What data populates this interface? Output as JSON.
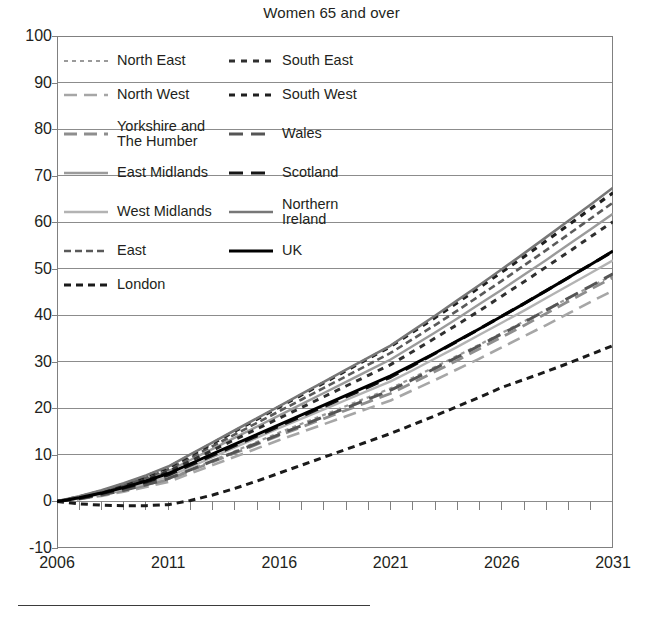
{
  "chart_data": {
    "type": "line",
    "title": "Women 65 and over",
    "xlabel": "",
    "ylabel": "",
    "xlim": [
      2006,
      2031
    ],
    "ylim": [
      -10,
      100
    ],
    "ytick_values": [
      100,
      90,
      80,
      70,
      60,
      50,
      40,
      30,
      20,
      10,
      0,
      -10
    ],
    "ytick_labels": [
      "100",
      "90",
      "80",
      "70",
      "60",
      "50",
      "40",
      "30",
      "20",
      "10",
      "0",
      "-10"
    ],
    "xtick_values": [
      2006,
      2011,
      2016,
      2021,
      2026,
      2031
    ],
    "xtick_labels": [
      "2006",
      "2011",
      "2016",
      "2021",
      "2026",
      "2031"
    ],
    "x_minor_tick_interval": 1,
    "grid": "horizontal",
    "legend_position": "top-left-inside",
    "x": [
      2006,
      2007,
      2008,
      2009,
      2010,
      2011,
      2012,
      2013,
      2014,
      2015,
      2016,
      2017,
      2018,
      2019,
      2020,
      2021,
      2022,
      2023,
      2024,
      2025,
      2026,
      2027,
      2028,
      2029,
      2030,
      2031
    ],
    "series": [
      {
        "name": "North East",
        "color": "#9a9a9a",
        "dash": "4,4",
        "width": 2.2,
        "values": [
          0,
          0.6,
          1.4,
          2.4,
          3.5,
          4.8,
          6.8,
          8.8,
          10.8,
          12.8,
          14.8,
          16.7,
          18.6,
          20.5,
          22.4,
          24.3,
          26.6,
          28.9,
          31.3,
          33.7,
          36.2,
          38.7,
          41.2,
          43.7,
          46.2,
          48.6
        ]
      },
      {
        "name": "North West",
        "color": "#a6a6a6",
        "dash": "13,7",
        "width": 2.6,
        "values": [
          0,
          0.5,
          1.2,
          2.1,
          3.1,
          4.2,
          6.0,
          7.8,
          9.6,
          11.4,
          13.2,
          14.9,
          16.6,
          18.3,
          20.0,
          21.7,
          23.9,
          26.1,
          28.4,
          30.7,
          33.1,
          35.5,
          37.9,
          40.4,
          42.9,
          45.3
        ]
      },
      {
        "name": "Yorkshire and\nThe Humber",
        "color": "#8e8e8e",
        "dash": "13,7",
        "width": 2.8,
        "values": [
          0,
          0.6,
          1.4,
          2.4,
          3.5,
          4.7,
          6.6,
          8.5,
          10.4,
          12.3,
          14.2,
          16.0,
          17.8,
          19.6,
          21.4,
          23.2,
          25.5,
          27.9,
          30.3,
          32.8,
          35.3,
          37.8,
          40.4,
          43.0,
          45.6,
          48.1
        ]
      },
      {
        "name": "East Midlands",
        "color": "#9b9b9b",
        "dash": "none",
        "width": 2.4,
        "values": [
          0,
          0.9,
          2.0,
          3.3,
          4.8,
          6.5,
          8.9,
          11.3,
          13.7,
          16.1,
          18.5,
          20.9,
          23.3,
          25.7,
          28.1,
          30.5,
          33.4,
          36.3,
          39.3,
          42.4,
          45.5,
          48.7,
          51.9,
          55.2,
          58.5,
          61.8
        ]
      },
      {
        "name": "West Midlands",
        "color": "#b3b3b3",
        "dash": "none",
        "width": 2.4,
        "values": [
          0,
          0.7,
          1.6,
          2.7,
          3.9,
          5.3,
          7.4,
          9.5,
          11.6,
          13.7,
          15.8,
          17.8,
          19.8,
          21.8,
          23.8,
          25.8,
          28.2,
          30.7,
          33.2,
          35.8,
          38.4,
          41.0,
          43.7,
          46.4,
          49.1,
          51.8
        ]
      },
      {
        "name": "East",
        "color": "#5a5a5a",
        "dash": "7,4",
        "width": 2.6,
        "values": [
          0,
          0.9,
          2.1,
          3.5,
          5.1,
          6.9,
          9.4,
          11.9,
          14.4,
          16.9,
          19.4,
          21.9,
          24.4,
          26.9,
          29.4,
          31.9,
          34.9,
          37.9,
          41.0,
          44.2,
          47.4,
          50.7,
          54.0,
          57.4,
          60.8,
          64.2
        ]
      },
      {
        "name": "London",
        "color": "#1a1a1a",
        "dash": "7,5",
        "width": 3.0,
        "values": [
          0,
          -0.5,
          -0.8,
          -0.9,
          -0.9,
          -0.7,
          0.2,
          1.4,
          2.8,
          4.4,
          6.1,
          7.8,
          9.5,
          11.2,
          12.9,
          14.6,
          16.5,
          18.4,
          20.4,
          22.4,
          24.5,
          26.2,
          27.9,
          29.7,
          31.6,
          33.5
        ]
      },
      {
        "name": "South East",
        "color": "#2f2f2f",
        "dash": "6,6",
        "width": 3.0,
        "values": [
          0,
          0.8,
          1.9,
          3.2,
          4.7,
          6.4,
          8.7,
          11.0,
          13.3,
          15.6,
          17.9,
          20.2,
          22.5,
          24.8,
          27.1,
          29.4,
          32.2,
          35.1,
          38.0,
          41.0,
          44.1,
          47.2,
          50.4,
          53.6,
          56.9,
          60.1
        ]
      },
      {
        "name": "South West",
        "color": "#1f1f1f",
        "dash": "6,6",
        "width": 3.2,
        "values": [
          0,
          1.0,
          2.2,
          3.7,
          5.4,
          7.3,
          9.9,
          12.5,
          15.1,
          17.7,
          20.3,
          22.9,
          25.5,
          28.1,
          30.7,
          33.3,
          36.4,
          39.5,
          42.7,
          46.0,
          49.3,
          52.6,
          56.0,
          59.4,
          62.9,
          66.3
        ]
      },
      {
        "name": "Wales",
        "color": "#555555",
        "dash": "14,8",
        "width": 3.0,
        "values": [
          0,
          0.6,
          1.4,
          2.4,
          3.6,
          4.9,
          6.8,
          8.7,
          10.6,
          12.5,
          14.4,
          16.3,
          18.2,
          20.1,
          22.0,
          23.9,
          26.2,
          28.6,
          31.0,
          33.5,
          36.0,
          38.5,
          41.1,
          43.7,
          46.3,
          48.9
        ]
      },
      {
        "name": "Scotland",
        "color": "#161616",
        "dash": "14,8",
        "width": 3.2,
        "values": [
          0,
          0.7,
          1.7,
          2.9,
          4.2,
          5.7,
          7.8,
          9.9,
          12.0,
          14.1,
          16.2,
          18.3,
          20.4,
          22.5,
          24.6,
          26.7,
          29.2,
          31.8,
          34.4,
          37.1,
          39.8,
          42.5,
          45.3,
          48.1,
          50.9,
          53.7
        ]
      },
      {
        "name": "Northern\nIreland",
        "color": "#777777",
        "dash": "none",
        "width": 2.6,
        "values": [
          0,
          1.1,
          2.4,
          3.9,
          5.6,
          7.5,
          10.1,
          12.7,
          15.3,
          17.9,
          20.5,
          23.1,
          25.7,
          28.3,
          30.9,
          33.5,
          36.7,
          39.9,
          43.2,
          46.5,
          49.9,
          53.3,
          56.8,
          60.3,
          63.8,
          67.4
        ]
      },
      {
        "name": "UK",
        "color": "#000000",
        "dash": "none",
        "width": 3.0,
        "values": [
          0,
          0.8,
          1.8,
          3.0,
          4.4,
          6.0,
          8.1,
          10.2,
          12.3,
          14.4,
          16.5,
          18.6,
          20.7,
          22.8,
          24.9,
          27.0,
          29.4,
          31.9,
          34.5,
          37.1,
          39.8,
          42.5,
          45.3,
          48.1,
          50.9,
          53.8
        ]
      }
    ]
  },
  "legend": {
    "items": [
      {
        "label": "North East",
        "column": "left",
        "color": "#9a9a9a",
        "dash": "4,4",
        "width": 2.2
      },
      {
        "label": "South East",
        "column": "right",
        "color": "#2f2f2f",
        "dash": "6,6",
        "width": 3.0
      },
      {
        "label": "North West",
        "column": "left",
        "color": "#a6a6a6",
        "dash": "13,7",
        "width": 2.6
      },
      {
        "label": "South West",
        "column": "right",
        "color": "#1f1f1f",
        "dash": "6,6",
        "width": 3.2
      },
      {
        "label": "Yorkshire and\nThe Humber",
        "column": "left",
        "color": "#8e8e8e",
        "dash": "13,7",
        "width": 2.8
      },
      {
        "label": "Wales",
        "column": "right",
        "color": "#555555",
        "dash": "14,8",
        "width": 3.0
      },
      {
        "label": "East Midlands",
        "column": "left",
        "color": "#9b9b9b",
        "dash": "none",
        "width": 2.4
      },
      {
        "label": "Scotland",
        "column": "right",
        "color": "#161616",
        "dash": "14,8",
        "width": 3.2
      },
      {
        "label": "West Midlands",
        "column": "left",
        "color": "#b3b3b3",
        "dash": "none",
        "width": 2.4
      },
      {
        "label": "Northern\nIreland",
        "column": "right",
        "color": "#777777",
        "dash": "none",
        "width": 2.6
      },
      {
        "label": "East",
        "column": "left",
        "color": "#5a5a5a",
        "dash": "7,4",
        "width": 2.6
      },
      {
        "label": "UK",
        "column": "right",
        "color": "#000000",
        "dash": "none",
        "width": 3.0
      },
      {
        "label": "London",
        "column": "left",
        "color": "#1a1a1a",
        "dash": "7,5",
        "width": 3.0
      }
    ]
  },
  "style": {
    "axis_color": "#808080",
    "grid_color": "#8c8c8c",
    "text_color": "#231f20",
    "background": "#ffffff",
    "rule_color": "#3b3b3b"
  }
}
